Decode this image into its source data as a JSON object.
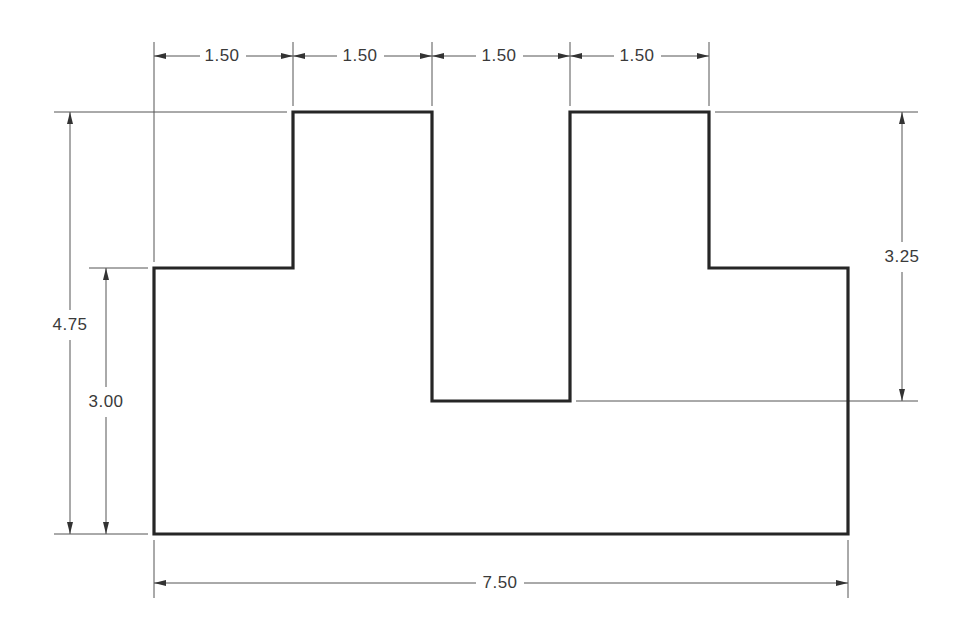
{
  "drawing": {
    "type": "orthographic dimensioned part drawing",
    "colors": {
      "outline": "#262626",
      "dimension_lines": "#555555",
      "text": "#3a3a3a",
      "background": "#ffffff"
    },
    "outline_points": [
      [
        154,
        268
      ],
      [
        293,
        268
      ],
      [
        293,
        112
      ],
      [
        432,
        112
      ],
      [
        432,
        401
      ],
      [
        570,
        401
      ],
      [
        570,
        112
      ],
      [
        709,
        112
      ],
      [
        709,
        268
      ],
      [
        848,
        268
      ],
      [
        848,
        534
      ],
      [
        154,
        534
      ]
    ],
    "dimensions": {
      "top": [
        {
          "label": "1.50",
          "x1": 154,
          "x2": 293,
          "y": 56,
          "text_x": 222
        },
        {
          "label": "1.50",
          "x1": 293,
          "x2": 432,
          "y": 56,
          "text_x": 360
        },
        {
          "label": "1.50",
          "x1": 432,
          "x2": 570,
          "y": 56,
          "text_x": 499
        },
        {
          "label": "1.50",
          "x1": 570,
          "x2": 709,
          "y": 56,
          "text_x": 637
        }
      ],
      "left_overall": {
        "label": "4.75",
        "x": 70,
        "y1": 112,
        "y2": 534,
        "text_y": 325
      },
      "left_step": {
        "label": "3.00",
        "x": 106,
        "y1": 268,
        "y2": 534,
        "text_y": 402
      },
      "right_slot": {
        "label": "3.25",
        "x": 902,
        "y1": 112,
        "y2": 401,
        "text_y": 257
      },
      "bottom_overall": {
        "label": "7.50",
        "x1": 154,
        "x2": 848,
        "y": 583,
        "text_x": 500
      }
    }
  }
}
